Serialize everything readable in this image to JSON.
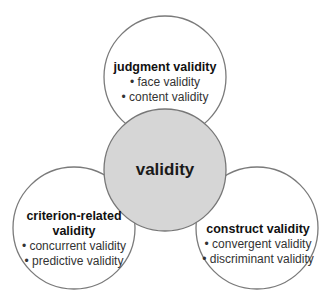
{
  "diagram": {
    "center": {
      "label": "validity",
      "fill": "#d6d6d6",
      "stroke": "#777777"
    },
    "nodes": [
      {
        "id": "judgment",
        "title": "judgment validity",
        "items": [
          "• face validity",
          "• content validity"
        ]
      },
      {
        "id": "criterion",
        "title_line1": "criterion-related",
        "title_line2": "validity",
        "items": [
          "• concurrent validity",
          "• predictive validity"
        ]
      },
      {
        "id": "construct",
        "title": "construct validity",
        "items": [
          "• convergent validity",
          "• discriminant validity"
        ]
      }
    ],
    "outer_fill": "#ffffff",
    "outer_stroke": "#7a7a7a"
  }
}
